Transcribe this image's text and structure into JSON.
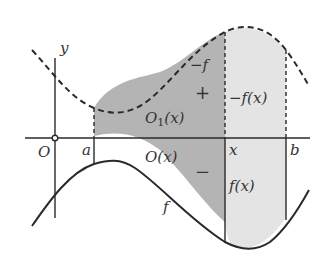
{
  "diagram": {
    "colors": {
      "dark_region": "#b4b4b4",
      "light_region": "#e4e4e4",
      "stroke": "#2a2a2a"
    },
    "labels": {
      "y_axis": "y",
      "origin": "O",
      "a": "a",
      "x": "x",
      "b": "b",
      "neg_f": "−f",
      "f": "f",
      "neg_f_x": "−f(x)",
      "f_x": "f(x)",
      "O1_x_main": "O",
      "O1_x_sub": "1",
      "O1_x_arg": "(x)",
      "O_x": "O(x)",
      "plus": "+",
      "minus": "−"
    }
  }
}
